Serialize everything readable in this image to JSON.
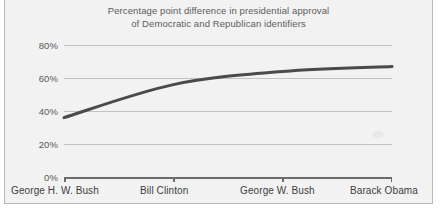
{
  "chart_data": {
    "type": "line",
    "title": "Percentage point difference in presidential approval\nof Democratic and Republican identifiers",
    "xlabel": "",
    "ylabel": "",
    "categories": [
      "George H. W. Bush",
      "Bill Clinton",
      "George W. Bush",
      "Barack Obama"
    ],
    "values": [
      36,
      56,
      64,
      67
    ],
    "series": [
      {
        "name": "Percentage point difference in presidential approval",
        "values": [
          36,
          56,
          64,
          67
        ]
      }
    ],
    "ylim": [
      0,
      85
    ],
    "ytick_labels": [
      "0%",
      "20%",
      "40%",
      "60%",
      "80%"
    ],
    "ytick_values": [
      0,
      20,
      40,
      60,
      80
    ],
    "grid": true,
    "legend": "none",
    "line_color": "#4a4a4a",
    "grid_color": "#c2c2c2",
    "axis_color": "#6b6b6b",
    "panel_color": "#f2f2f2",
    "title_color": "#5c5c5c"
  }
}
